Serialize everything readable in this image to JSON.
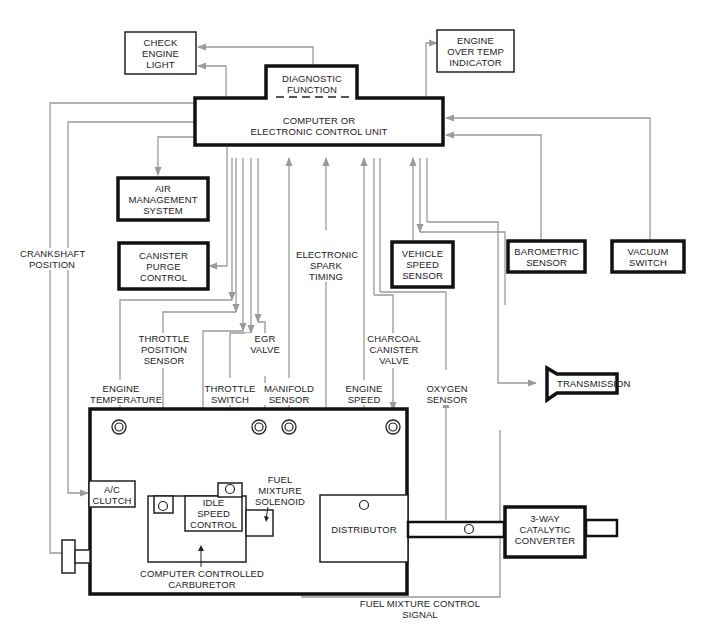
{
  "ecu": {
    "diagnostic": "DIAGNOSTIC\nFUNCTION",
    "title": "COMPUTER OR\nELECTRONIC CONTROL UNIT"
  },
  "outputs": {
    "check_engine_light": "CHECK\nENGINE\nLIGHT",
    "engine_over_temp": "ENGINE\nOVER TEMP\nINDICATOR",
    "air_management": "AIR\nMANAGEMENT\nSYSTEM",
    "canister_purge": "CANISTER\nPURGE\nCONTROL",
    "transmission": "TRANSMISSION"
  },
  "sensors": {
    "vehicle_speed": "VEHICLE\nSPEED\nSENSOR",
    "barometric": "BAROMETRIC\nSENSOR",
    "vacuum_switch": "VACUUM\nSWITCH"
  },
  "signal_labels": {
    "crankshaft_position": "CRANKSHAFT\nPOSITION",
    "electronic_spark_timing": "ELECTRONIC\nSPARK\nTIMING",
    "throttle_position_sensor": "THROTTLE\nPOSITION\nSENSOR",
    "egr_valve": "EGR\nVALVE",
    "charcoal_canister_valve": "CHARCOAL\nCANISTER\nVALVE",
    "engine_temperature": "ENGINE\nTEMPERATURE",
    "throttle_switch": "THROTTLE\nSWITCH",
    "manifold_sensor": "MANIFOLD\nSENSOR",
    "engine_speed": "ENGINE\nSPEED",
    "oxygen_sensor": "OXYGEN\nSENSOR",
    "fuel_mixture_control_signal": "FUEL MIXTURE CONTROL\nSIGNAL"
  },
  "engine": {
    "ac_clutch": "A/C\nCLUTCH",
    "idle_speed_control": "IDLE\nSPEED\nCONTROL",
    "fuel_mixture_solenoid": "FUEL\nMIXTURE\nSOLENOID",
    "carburetor": "COMPUTER CONTROLLED\nCARBURETOR",
    "distributor": "DISTRIBUTOR",
    "catalytic_converter": "3-WAY\nCATALYTIC\nCONVERTER"
  }
}
